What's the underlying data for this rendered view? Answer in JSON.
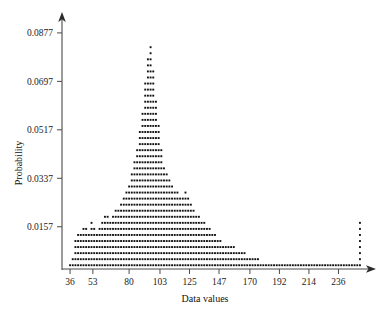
{
  "chart_data": {
    "type": "scatter",
    "title": "",
    "subtitle": "",
    "xlabel": "Data values",
    "ylabel": "Probability",
    "legend": [],
    "legend_position": "none",
    "grid": false,
    "plot_style": "dot-plot stacked column histogram, right-skewed with far-right spike",
    "xticks": [
      36,
      53,
      80,
      103,
      125,
      147,
      170,
      192,
      214,
      236
    ],
    "xtick_labels": [
      "36",
      "53",
      "80",
      "103",
      "125",
      "147",
      "170",
      "192",
      "214",
      "236"
    ],
    "yticks": [
      0.0157,
      0.0337,
      0.0517,
      0.0697,
      0.0877
    ],
    "ytick_labels": [
      "0.0157",
      "0.0337",
      "0.0517",
      "0.0697",
      "0.0877"
    ],
    "xlim": [
      30,
      258
    ],
    "ylim": [
      0,
      0.0925
    ],
    "dot_step": 0.00225,
    "marker": "square",
    "marker_color": "#121212",
    "axis_color": "#4a4a4a",
    "x": [
      36,
      38,
      40,
      42,
      44,
      46,
      48,
      50,
      52,
      54,
      56,
      58,
      60,
      62,
      64,
      66,
      68,
      70,
      72,
      74,
      76,
      78,
      80,
      82,
      84,
      86,
      88,
      90,
      92,
      94,
      96,
      98,
      100,
      102,
      104,
      106,
      108,
      110,
      112,
      114,
      116,
      118,
      120,
      122,
      124,
      126,
      128,
      130,
      132,
      134,
      136,
      138,
      140,
      142,
      144,
      146,
      148,
      150,
      152,
      154,
      156,
      158,
      160,
      162,
      164,
      166,
      168,
      170,
      172,
      174,
      176,
      178,
      180,
      182,
      184,
      186,
      188,
      190,
      192,
      194,
      196,
      198,
      200,
      202,
      204,
      206,
      208,
      210,
      212,
      214,
      216,
      218,
      220,
      222,
      224,
      226,
      228,
      230,
      232,
      234,
      236,
      238,
      240,
      242,
      244,
      246,
      248,
      250,
      252
    ],
    "counts": [
      1,
      2,
      5,
      6,
      6,
      7,
      7,
      6,
      8,
      7,
      6,
      7,
      8,
      9,
      9,
      8,
      9,
      10,
      10,
      11,
      12,
      13,
      14,
      16,
      18,
      20,
      23,
      26,
      31,
      35,
      37,
      33,
      28,
      24,
      20,
      17,
      16,
      15,
      14,
      13,
      13,
      12,
      12,
      13,
      12,
      11,
      10,
      9,
      9,
      8,
      8,
      7,
      7,
      6,
      6,
      5,
      5,
      4,
      4,
      4,
      4,
      4,
      3,
      3,
      3,
      3,
      2,
      2,
      2,
      2,
      2,
      1,
      1,
      1,
      1,
      1,
      1,
      1,
      1,
      1,
      1,
      1,
      1,
      1,
      1,
      1,
      1,
      1,
      1,
      1,
      1,
      1,
      1,
      1,
      1,
      1,
      1,
      1,
      1,
      1,
      1,
      1,
      1,
      1,
      1,
      1,
      1,
      1,
      8
    ],
    "peak": {
      "x": 96,
      "probability": 0.0877
    },
    "far_right_spike": {
      "x": 252,
      "height_dots": 8
    }
  }
}
